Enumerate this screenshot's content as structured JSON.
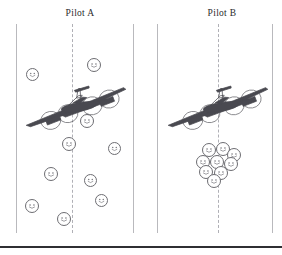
{
  "figure": {
    "background_color": "#ffffff",
    "rule_color": "#2f2f33",
    "rail_color": "#b9b9bd",
    "dash_color": "#b0b0b6",
    "smiley_color": "#6d6d72",
    "plane_color": "#4a4a50"
  },
  "panels": [
    {
      "id": "pilot-a",
      "title": "Pilot A",
      "left_rail_x": 16,
      "right_rail_x": 133,
      "center_dash_x": 72,
      "aircraft": {
        "name": "four-engine-bomber",
        "x": 22,
        "y": 86,
        "width": 112,
        "height": 42,
        "rotation_deg": -9
      },
      "smileys": [
        {
          "cx": 32,
          "cy": 74,
          "d": 13
        },
        {
          "cx": 94,
          "cy": 65,
          "d": 14
        },
        {
          "cx": 87,
          "cy": 121,
          "d": 14
        },
        {
          "cx": 69,
          "cy": 144,
          "d": 14
        },
        {
          "cx": 114,
          "cy": 148,
          "d": 13
        },
        {
          "cx": 51,
          "cy": 174,
          "d": 14
        },
        {
          "cx": 90,
          "cy": 180,
          "d": 13
        },
        {
          "cx": 101,
          "cy": 200,
          "d": 13
        },
        {
          "cx": 32,
          "cy": 206,
          "d": 14
        },
        {
          "cx": 64,
          "cy": 219,
          "d": 14
        }
      ]
    },
    {
      "id": "pilot-b",
      "title": "Pilot B",
      "left_rail_x": 157,
      "right_rail_x": 272,
      "center_dash_x": 218,
      "aircraft": {
        "name": "four-engine-bomber",
        "x": 164,
        "y": 86,
        "width": 112,
        "height": 42,
        "rotation_deg": -9
      },
      "smileys": [
        {
          "cx": 209,
          "cy": 150,
          "d": 14
        },
        {
          "cx": 223,
          "cy": 149,
          "d": 14
        },
        {
          "cx": 234,
          "cy": 155,
          "d": 14
        },
        {
          "cx": 203,
          "cy": 162,
          "d": 14
        },
        {
          "cx": 217,
          "cy": 162,
          "d": 14
        },
        {
          "cx": 231,
          "cy": 164,
          "d": 14
        },
        {
          "cx": 206,
          "cy": 172,
          "d": 14
        },
        {
          "cx": 221,
          "cy": 173,
          "d": 14
        },
        {
          "cx": 214,
          "cy": 181,
          "d": 14
        }
      ]
    }
  ],
  "baseline_rule": {
    "y": 246,
    "height": 2
  }
}
